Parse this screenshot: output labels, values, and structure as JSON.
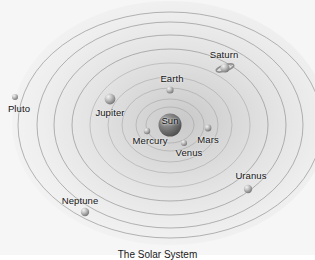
{
  "diagram": {
    "title": "The Solar System",
    "caption": "The Solar System",
    "background_color": "#f6f6f6",
    "orbit_color": "#8c8c8c",
    "center": {
      "x": 170,
      "y": 125
    },
    "sun": {
      "name": "Sun",
      "label": "Sun",
      "x": 170,
      "y": 125,
      "radius": 11.5,
      "label_x": 170,
      "label_y": 121,
      "color": "#6e6e6e"
    },
    "bodies": [
      {
        "name": "Mercury",
        "label": "Mercury",
        "x": 147,
        "y": 131,
        "radius": 3.2,
        "label_x": 150,
        "label_y": 141,
        "orbit_rx": 24,
        "orbit_ry": 18,
        "color": "#b9b9b9"
      },
      {
        "name": "Venus",
        "label": "Venus",
        "x": 184,
        "y": 143,
        "radius": 3.0,
        "label_x": 189,
        "label_y": 153,
        "orbit_rx": 34,
        "orbit_ry": 26,
        "color": "#c2c2c2"
      },
      {
        "name": "Earth",
        "label": "Earth",
        "x": 170,
        "y": 90,
        "radius": 3.6,
        "label_x": 172,
        "label_y": 79,
        "orbit_rx": 48,
        "orbit_ry": 37,
        "color": "#bdbdbd"
      },
      {
        "name": "Mars",
        "label": "Mars",
        "x": 208,
        "y": 128,
        "radius": 3.4,
        "label_x": 208,
        "label_y": 140,
        "orbit_rx": 62,
        "orbit_ry": 48,
        "color": "#b5b5b5"
      },
      {
        "name": "Jupiter",
        "label": "Jupiter",
        "x": 110,
        "y": 99,
        "radius": 5.4,
        "label_x": 110,
        "label_y": 113,
        "orbit_rx": 80,
        "orbit_ry": 62,
        "color": "#c6c6c6"
      },
      {
        "name": "Saturn",
        "label": "Saturn",
        "x": 225,
        "y": 68,
        "radius": 4.6,
        "label_x": 224,
        "label_y": 55,
        "orbit_rx": 98,
        "orbit_ry": 76,
        "color": "#bcbcbc",
        "has_ring": true
      },
      {
        "name": "Uranus",
        "label": "Uranus",
        "x": 248,
        "y": 189,
        "radius": 4.2,
        "label_x": 251,
        "label_y": 176,
        "orbit_rx": 116,
        "orbit_ry": 90,
        "color": "#b9b9b9"
      },
      {
        "name": "Neptune",
        "label": "Neptune",
        "x": 85,
        "y": 212,
        "radius": 4.2,
        "label_x": 80,
        "label_y": 201,
        "orbit_rx": 133,
        "orbit_ry": 103,
        "color": "#bfbfbf"
      },
      {
        "name": "Pluto",
        "label": "Pluto",
        "x": 15,
        "y": 97,
        "radius": 3.0,
        "label_x": 19,
        "label_y": 109,
        "orbit_rx": 152,
        "orbit_ry": 113,
        "color": "#9e9e9e"
      }
    ]
  }
}
